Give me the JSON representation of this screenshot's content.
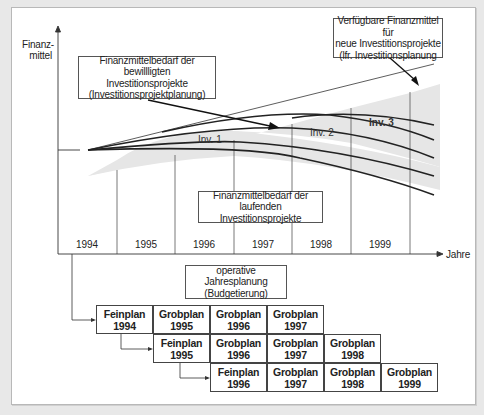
{
  "diagram": {
    "y_axis_label": [
      "Finanz-",
      "mittel"
    ],
    "x_axis_label": "Jahre",
    "years": [
      "1994",
      "1995",
      "1996",
      "1997",
      "1998",
      "1999"
    ],
    "callouts": {
      "approved": [
        "Finanzmittelbedarf der bewillligten",
        "Investitionsprojekte",
        "(Investitionsprojektplanung)"
      ],
      "available": [
        "Verfügbare Finanzmittel für",
        "neue Investitionsprojekte",
        "(lfr. Investitionsplanung"
      ],
      "running": [
        "Finanzmittelbedarf der",
        "laufenden Investitionsprojekte"
      ],
      "budget": [
        "operative Jahresplanung",
        "(Budgetierung)"
      ]
    },
    "investments": [
      {
        "label": "Inv. 1",
        "bold": false
      },
      {
        "label": "Inv. 2",
        "bold": false
      },
      {
        "label": "Inv. 3",
        "bold": true
      }
    ],
    "plan_rows": [
      [
        {
          "type": "Feinplan",
          "year": "1994"
        },
        {
          "type": "Grobplan",
          "year": "1995"
        },
        {
          "type": "Grobplan",
          "year": "1996"
        },
        {
          "type": "Grobplan",
          "year": "1997"
        }
      ],
      [
        {
          "type": "Feinplan",
          "year": "1995"
        },
        {
          "type": "Grobplan",
          "year": "1996"
        },
        {
          "type": "Grobplan",
          "year": "1997"
        },
        {
          "type": "Grobplan",
          "year": "1998"
        }
      ],
      [
        {
          "type": "Feinplan",
          "year": "1996"
        },
        {
          "type": "Grobplan",
          "year": "1997"
        },
        {
          "type": "Grobplan",
          "year": "1998"
        },
        {
          "type": "Grobplan",
          "year": "1999"
        }
      ]
    ],
    "colors": {
      "shade": "#e6e6e6",
      "line": "#222222",
      "background": "#e8e8e8"
    }
  }
}
